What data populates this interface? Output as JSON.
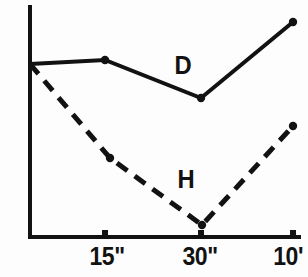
{
  "chart_data": {
    "type": "line",
    "title": "",
    "xlabel": "",
    "ylabel": "",
    "grid": false,
    "legend_position": "inline-annotation",
    "x_tick_labels": [
      "15\"",
      "30\"",
      "10'"
    ],
    "x_tick_positions": [
      105,
      201,
      293
    ],
    "y_axis_labels": [],
    "x": [
      "0",
      "15\"",
      "30\"",
      "10'"
    ],
    "series": [
      {
        "name": "D",
        "style": "solid",
        "color": "#121212",
        "points": [
          {
            "x": 30,
            "y": 64
          },
          {
            "x": 105,
            "y": 60
          },
          {
            "x": 201,
            "y": 98
          },
          {
            "x": 293,
            "y": 22
          }
        ],
        "markers": [
          {
            "x": 105,
            "y": 60
          },
          {
            "x": 201,
            "y": 98
          },
          {
            "x": 293,
            "y": 22
          }
        ],
        "label": "D"
      },
      {
        "name": "H",
        "style": "dashed",
        "color": "#121212",
        "points": [
          {
            "x": 30,
            "y": 64
          },
          {
            "x": 110,
            "y": 158
          },
          {
            "x": 202,
            "y": 225
          },
          {
            "x": 293,
            "y": 126
          }
        ],
        "markers": [
          {
            "x": 110,
            "y": 158
          },
          {
            "x": 202,
            "y": 225
          },
          {
            "x": 293,
            "y": 126
          }
        ],
        "label": "H"
      }
    ],
    "axes": {
      "y_axis": {
        "x": 30,
        "y_top": 5,
        "y_bottom": 237
      },
      "x_axis": {
        "y": 237,
        "x_left": 30,
        "x_right": 300
      }
    }
  },
  "labels": {
    "tick_0": "15\"",
    "tick_1": "30\"",
    "tick_2": "10'",
    "series_d": "D",
    "series_h": "H"
  },
  "colors": {
    "ink": "#121212",
    "background": "#fdfdfd"
  }
}
